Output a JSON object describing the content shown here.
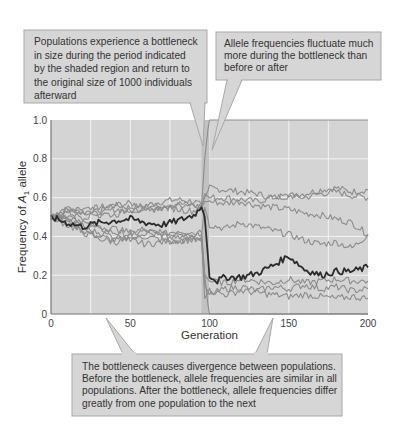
{
  "chart_data": {
    "type": "line",
    "title": "",
    "xlabel": "Generation",
    "ylabel": "Frequency of A1 allele",
    "ylabel_parts": {
      "pre": "Frequency of ",
      "italic": "A",
      "sub": "1",
      "post": " allele"
    },
    "xlim": [
      0,
      200
    ],
    "ylim": [
      0,
      1.0
    ],
    "x_ticks": [
      "0",
      "50",
      "100",
      "150",
      "200"
    ],
    "y_ticks": [
      "0",
      "0.2",
      "0.4",
      "0.6",
      "0.8",
      "1.0"
    ],
    "grid": true,
    "legend": null,
    "shaded_region": {
      "x_start": 95,
      "x_end": 100,
      "label": "bottleneck"
    },
    "colors": {
      "plot_bg": "#d4d4d4",
      "grid": "#f2f2f2",
      "shade": "#bdbdbd",
      "series": "#8c8c8c",
      "highlight": "#2b2b2b",
      "callout_bg": "#d6d6d6",
      "callout_border": "#a8a8a8"
    },
    "series": [
      {
        "name": "Population 1 (highlighted)",
        "highlight": true,
        "x": [
          0,
          10,
          20,
          30,
          40,
          50,
          60,
          70,
          80,
          90,
          95,
          97,
          100,
          105,
          110,
          120,
          130,
          140,
          150,
          160,
          170,
          180,
          190,
          200
        ],
        "values": [
          0.5,
          0.47,
          0.45,
          0.47,
          0.48,
          0.49,
          0.47,
          0.46,
          0.48,
          0.51,
          0.55,
          0.5,
          0.2,
          0.17,
          0.19,
          0.19,
          0.21,
          0.25,
          0.3,
          0.23,
          0.2,
          0.22,
          0.22,
          0.24
        ]
      },
      {
        "name": "Population 2",
        "x": [
          0,
          10,
          20,
          30,
          40,
          50,
          60,
          70,
          80,
          90,
          95,
          97,
          100,
          110,
          120,
          130,
          140,
          150,
          160,
          170,
          180,
          190,
          200
        ],
        "values": [
          0.5,
          0.54,
          0.52,
          0.55,
          0.56,
          0.55,
          0.56,
          0.58,
          0.59,
          0.58,
          0.56,
          0.6,
          0.65,
          0.64,
          0.63,
          0.62,
          0.6,
          0.61,
          0.62,
          0.64,
          0.65,
          0.63,
          0.64
        ]
      },
      {
        "name": "Population 3",
        "x": [
          0,
          10,
          20,
          30,
          40,
          50,
          60,
          70,
          80,
          90,
          95,
          97,
          100,
          110,
          120,
          130,
          140,
          150,
          160,
          170,
          180,
          190,
          200
        ],
        "values": [
          0.5,
          0.52,
          0.54,
          0.53,
          0.56,
          0.57,
          0.55,
          0.54,
          0.56,
          0.57,
          0.55,
          0.62,
          0.6,
          0.6,
          0.59,
          0.58,
          0.6,
          0.61,
          0.6,
          0.62,
          0.63,
          0.61,
          0.6
        ]
      },
      {
        "name": "Population 4",
        "x": [
          0,
          10,
          20,
          30,
          40,
          50,
          60,
          70,
          80,
          90,
          95,
          97,
          100,
          110,
          120,
          130,
          140,
          150,
          160,
          170,
          180,
          190,
          200
        ],
        "values": [
          0.5,
          0.55,
          0.53,
          0.51,
          0.54,
          0.53,
          0.55,
          0.56,
          0.57,
          0.56,
          0.55,
          0.58,
          0.58,
          0.57,
          0.58,
          0.56,
          0.55,
          0.54,
          0.52,
          0.51,
          0.49,
          0.47,
          0.41
        ]
      },
      {
        "name": "Population 5",
        "x": [
          0,
          10,
          20,
          30,
          40,
          50,
          60,
          70,
          80,
          90,
          95,
          97,
          100,
          110,
          120,
          130,
          140,
          150,
          160,
          170,
          180,
          190,
          200
        ],
        "values": [
          0.5,
          0.51,
          0.46,
          0.44,
          0.42,
          0.41,
          0.43,
          0.41,
          0.43,
          0.42,
          0.41,
          0.55,
          0.46,
          0.44,
          0.47,
          0.45,
          0.43,
          0.41,
          0.38,
          0.36,
          0.37,
          0.34,
          0.41
        ]
      },
      {
        "name": "Population 6",
        "x": [
          0,
          10,
          20,
          30,
          40,
          50,
          60,
          70,
          80,
          90,
          95,
          97,
          100,
          110,
          120,
          130,
          140,
          150,
          160,
          170,
          180,
          190,
          200
        ],
        "values": [
          0.5,
          0.48,
          0.43,
          0.4,
          0.38,
          0.39,
          0.4,
          0.38,
          0.37,
          0.39,
          0.4,
          0.2,
          0.17,
          0.16,
          0.18,
          0.17,
          0.16,
          0.18,
          0.16,
          0.17,
          0.18,
          0.17,
          0.17
        ]
      },
      {
        "name": "Population 7",
        "x": [
          0,
          10,
          20,
          30,
          40,
          50,
          60,
          70,
          80,
          90,
          95,
          97,
          100,
          110,
          120,
          130,
          140,
          150,
          160,
          170,
          180,
          190,
          200
        ],
        "values": [
          0.5,
          0.46,
          0.42,
          0.39,
          0.37,
          0.38,
          0.36,
          0.37,
          0.38,
          0.38,
          0.37,
          0.15,
          0.1,
          0.13,
          0.14,
          0.12,
          0.14,
          0.13,
          0.15,
          0.13,
          0.14,
          0.12,
          0.13
        ]
      },
      {
        "name": "Population 8",
        "x": [
          0,
          10,
          20,
          30,
          40,
          50,
          60,
          70,
          80,
          90,
          95,
          97,
          100,
          110,
          120,
          130,
          140,
          150,
          160,
          170,
          180,
          190,
          200
        ],
        "values": [
          0.5,
          0.49,
          0.44,
          0.42,
          0.4,
          0.4,
          0.42,
          0.4,
          0.39,
          0.41,
          0.39,
          0.08,
          0.12,
          0.1,
          0.12,
          0.11,
          0.1,
          0.09,
          0.1,
          0.09,
          0.08,
          0.09,
          0.08
        ]
      },
      {
        "name": "Population 9 (fixed at 1.0)",
        "x": [
          0,
          10,
          20,
          30,
          40,
          50,
          60,
          70,
          80,
          90,
          95,
          97,
          99,
          100,
          200
        ],
        "values": [
          0.5,
          0.53,
          0.5,
          0.52,
          0.51,
          0.54,
          0.53,
          0.55,
          0.54,
          0.53,
          0.56,
          0.8,
          0.95,
          1.0,
          1.0
        ]
      },
      {
        "name": "Population 10 (lost, 0.0)",
        "x": [
          0,
          10,
          20,
          30,
          40,
          50,
          60,
          70,
          80,
          90,
          95,
          97,
          99,
          100,
          200
        ],
        "values": [
          0.5,
          0.5,
          0.47,
          0.45,
          0.44,
          0.42,
          0.44,
          0.42,
          0.41,
          0.4,
          0.42,
          0.2,
          0.05,
          0.0,
          0.0
        ]
      }
    ]
  },
  "callouts": [
    {
      "id": "bottleneck-size",
      "lines": [
        "Populations experience a bottleneck",
        "in size during the period indicated",
        "by the shaded region and return to",
        "the original size of 1000 individuals",
        "afterward"
      ]
    },
    {
      "id": "fluctuation",
      "lines": [
        "Allele frequencies fluctuate much",
        "more during the bottleneck than",
        "before or after"
      ]
    },
    {
      "id": "divergence",
      "lines": [
        "The bottleneck causes divergence between populations.",
        "Before the bottleneck, allele frequencies are similar in all",
        "populations. After the bottleneck, allele frequencies differ",
        "greatly from one population to the next"
      ]
    }
  ]
}
